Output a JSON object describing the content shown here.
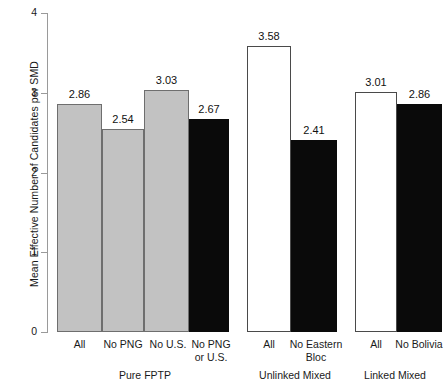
{
  "chart_data": {
    "type": "bar",
    "title": "",
    "xlabel": "",
    "ylabel": "Mean Effective Number of Candidates per SMD",
    "ylim": [
      0,
      4
    ],
    "yticks": [
      "0",
      "1",
      "2",
      "3",
      "4"
    ],
    "grid": false,
    "legend": "none",
    "groups": [
      {
        "name": "Pure FPTP",
        "bars": [
          {
            "label": "All",
            "value": 2.86,
            "value_text": "2.86",
            "fill": "gray"
          },
          {
            "label": "No PNG",
            "value": 2.54,
            "value_text": "2.54",
            "fill": "gray"
          },
          {
            "label": "No U.S.",
            "value": 3.03,
            "value_text": "3.03",
            "fill": "gray"
          },
          {
            "label": "No PNG or U.S.",
            "value": 2.67,
            "value_text": "2.67",
            "fill": "black"
          }
        ]
      },
      {
        "name": "Unlinked Mixed",
        "bars": [
          {
            "label": "All",
            "value": 3.58,
            "value_text": "3.58",
            "fill": "white"
          },
          {
            "label": "No Eastern Bloc",
            "value": 2.41,
            "value_text": "2.41",
            "fill": "black"
          }
        ]
      },
      {
        "name": "Linked Mixed",
        "bars": [
          {
            "label": "All",
            "value": 3.01,
            "value_text": "3.01",
            "fill": "white"
          },
          {
            "label": "No Bolivia",
            "value": 2.86,
            "value_text": "2.86",
            "fill": "black"
          }
        ]
      }
    ],
    "categories": [
      "All",
      "No PNG",
      "No U.S.",
      "No PNG or U.S.",
      "All",
      "No Eastern Bloc",
      "All",
      "No Bolivia"
    ],
    "values": [
      2.86,
      2.54,
      3.03,
      2.67,
      3.58,
      2.41,
      3.01,
      2.86
    ],
    "colors": {
      "gray": "#c2c2c2",
      "black": "#0a0a0a",
      "white": "#ffffff",
      "outline": "#6e6e6e",
      "axis": "#9a9a9a",
      "text": "#1a1a1a"
    }
  },
  "layout": {
    "axis_x": 47,
    "baseline_y": 332,
    "top_y": 13,
    "px_per_unit": 79.75,
    "bars_px": [
      {
        "x": 57,
        "w": 45
      },
      {
        "x": 102,
        "w": 42
      },
      {
        "x": 144,
        "w": 45
      },
      {
        "x": 189,
        "w": 40
      },
      {
        "x": 247,
        "w": 44
      },
      {
        "x": 291,
        "w": 46
      },
      {
        "x": 355,
        "w": 42
      },
      {
        "x": 397,
        "w": 45
      }
    ],
    "cat_labels_px": [
      {
        "x": 57,
        "w": 45,
        "lines": [
          "All"
        ]
      },
      {
        "x": 97,
        "w": 52,
        "lines": [
          "No PNG"
        ]
      },
      {
        "x": 143,
        "w": 50,
        "lines": [
          "No U.S."
        ]
      },
      {
        "x": 187,
        "w": 48,
        "lines": [
          "No PNG",
          "or U.S."
        ]
      },
      {
        "x": 247,
        "w": 44,
        "lines": [
          "All"
        ]
      },
      {
        "x": 285,
        "w": 62,
        "lines": [
          "No Eastern",
          "Bloc"
        ]
      },
      {
        "x": 355,
        "w": 42,
        "lines": [
          "All"
        ]
      },
      {
        "x": 390,
        "w": 58,
        "lines": [
          "No Bolivia"
        ]
      }
    ],
    "group_labels_px": [
      {
        "x": 80,
        "w": 130,
        "y": 369
      },
      {
        "x": 232,
        "w": 126,
        "y": 369
      },
      {
        "x": 340,
        "w": 110,
        "y": 369
      }
    ]
  }
}
